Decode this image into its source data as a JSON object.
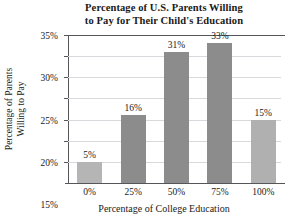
{
  "chart_data": {
    "type": "bar",
    "title": "Percentage of U.S. Parents Willing to Pay for Their Child's Education",
    "title_lines": [
      "Percentage of U.S. Parents Willing",
      "to Pay for Their Child's Education"
    ],
    "xlabel": "Percentage of College Education",
    "ylabel": "Percentage of Parents Willing to Pay",
    "ylabel_lines": [
      "Percentage of Parents",
      "Willing to Pay"
    ],
    "categories": [
      "0%",
      "25%",
      "50%",
      "75%",
      "100%"
    ],
    "values": [
      5,
      16,
      31,
      33,
      15
    ],
    "value_labels": [
      "5%",
      "16%",
      "31%",
      "33%",
      "15%"
    ],
    "ylim": [
      0,
      35
    ],
    "ytick_values": [
      5,
      10,
      15,
      20,
      25,
      30,
      35
    ],
    "ytick_labels": [
      "5%",
      "10%",
      "15%",
      "20%",
      "25%",
      "30%",
      "35%"
    ],
    "grid": true,
    "legend": false,
    "bar_colors": [
      "#b5b5b5",
      "#8c8c8c",
      "#8c8c8c",
      "#8c8c8c",
      "#b0b0b0"
    ],
    "axis_color": "#55555a",
    "grid_color": "#d9d9dd",
    "background": "#ffffff"
  }
}
